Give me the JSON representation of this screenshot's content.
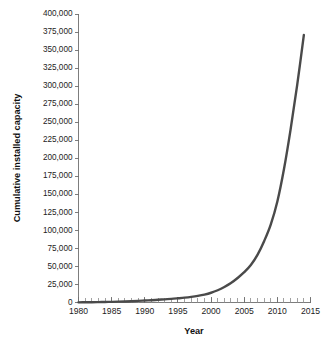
{
  "chart_data": {
    "type": "line",
    "title": "",
    "subtitle": "",
    "xlabel": "Year",
    "ylabel": "Cumulative installed capacity",
    "xlim": [
      1980,
      2015
    ],
    "ylim": [
      0,
      400000
    ],
    "grid": false,
    "legend": false,
    "legend_position": "none",
    "x_tick_labels": [
      "1980",
      "1985",
      "1990",
      "1995",
      "2000",
      "2005",
      "2010",
      "2015"
    ],
    "x_tick_values": [
      1980,
      1985,
      1990,
      1995,
      2000,
      2005,
      2010,
      2015
    ],
    "x_minor_tick_step": 1,
    "y_tick_labels": [
      "0",
      "25,000",
      "50,000",
      "75,000",
      "100,000",
      "125,000",
      "150,000",
      "175,000",
      "200,000",
      "225,000",
      "250,000",
      "275,000",
      "300,000",
      "325,000",
      "350,000",
      "375,000",
      "400,000"
    ],
    "y_tick_values": [
      0,
      25000,
      50000,
      75000,
      100000,
      125000,
      150000,
      175000,
      200000,
      225000,
      250000,
      275000,
      300000,
      325000,
      350000,
      375000,
      400000
    ],
    "series": [
      {
        "name": "Cumulative installed capacity",
        "color": "#4a4a4a",
        "x": [
          1980,
          1981,
          1982,
          1983,
          1984,
          1985,
          1986,
          1987,
          1988,
          1989,
          1990,
          1991,
          1992,
          1993,
          1994,
          1995,
          1996,
          1997,
          1998,
          1999,
          2000,
          2001,
          2002,
          2003,
          2004,
          2005,
          2006,
          2007,
          2008,
          2009,
          2010,
          2011,
          2012,
          2013,
          2014
        ],
        "values": [
          200,
          300,
          400,
          550,
          700,
          900,
          1150,
          1450,
          1800,
          2200,
          2700,
          3200,
          3800,
          4400,
          5000,
          5800,
          6700,
          7800,
          9200,
          11000,
          13500,
          17000,
          21500,
          27000,
          34000,
          42000,
          52000,
          66000,
          85000,
          108000,
          140000,
          185000,
          240000,
          302000,
          371000
        ]
      }
    ]
  }
}
